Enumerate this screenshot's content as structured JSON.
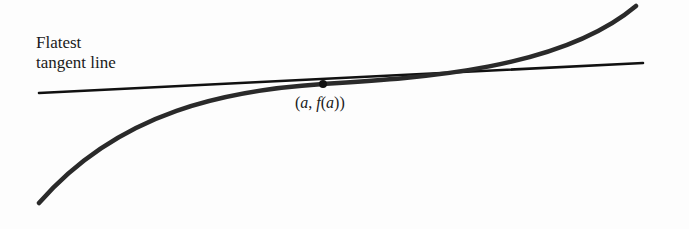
{
  "diagram": {
    "title_line1": "Flatest",
    "title_line2": "tangent line",
    "point_label_open": "(",
    "point_label_a": "a",
    "point_label_sep": ", ",
    "point_label_f": "f",
    "point_label_paren": "(",
    "point_label_a2": "a",
    "point_label_close": "))",
    "colors": {
      "curve": "#2a2a2a",
      "tangent": "#111111",
      "text": "#1a1a1a",
      "background": "#fdfdfd"
    },
    "elements": {
      "curve": "cubic curve with inflection point at (a, f(a))",
      "tangent_line": "tangent line at inflection point",
      "point": "(a, f(a))"
    }
  }
}
